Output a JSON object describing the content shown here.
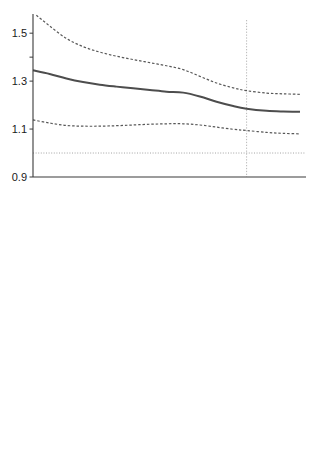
{
  "figure": {
    "background": "#ffffff",
    "width": 315,
    "height": 449
  },
  "panel_a": {
    "title": "a. World",
    "xlabel": "year",
    "ylabel": "γ̂Gl",
    "ylabel_base": "γ",
    "ylabel_sub": "Gl",
    "annotations": {
      "realisation": "realisation",
      "prediction": "prediction",
      "zipf": "Zipf",
      "series": "World"
    }
  },
  "panel_b": {
    "title": "b. Continents",
    "xlabel": "year",
    "ylabel": "γ̂Gl",
    "ylabel_base": "γ",
    "ylabel_sub": "Gl",
    "annotations": {
      "realisation": "realisation",
      "prediction": "prediction",
      "zipf": "Zipf"
    }
  },
  "chart_data": [
    {
      "type": "line",
      "title": "a. World",
      "xlabel": "year",
      "ylabel": "γ̂Gl",
      "xlim": [
        1950,
        2030
      ],
      "ylim": [
        0.9,
        1.58
      ],
      "xticks": [
        1950,
        1970,
        1990,
        2010,
        2030
      ],
      "xticks_minor": [
        1960,
        1980,
        2000,
        2020
      ],
      "yticks": [
        0.9,
        1.1,
        1.3,
        1.5
      ],
      "grid": false,
      "legend": "inline-labels",
      "divider_x": 2014,
      "divider_label_left": "realisation",
      "divider_label_right": "prediction",
      "reference_lines": [
        {
          "name": "Zipf",
          "y": 1.0,
          "style": "dotted",
          "color": "#9a9a9a"
        }
      ],
      "series": [
        {
          "name": "World",
          "style": "solid",
          "color": "#4d4d4d",
          "width": 2.0,
          "x": [
            1950,
            1955,
            1960,
            1965,
            1970,
            1975,
            1980,
            1985,
            1990,
            1995,
            2000,
            2005,
            2010,
            2014,
            2020,
            2025,
            2030
          ],
          "values": [
            1.345,
            1.33,
            1.311,
            1.296,
            1.285,
            1.277,
            1.27,
            1.263,
            1.256,
            1.252,
            1.236,
            1.214,
            1.196,
            1.185,
            1.176,
            1.173,
            1.172
          ]
        },
        {
          "name": "upper confidence bound",
          "style": "dashed",
          "color": "#585858",
          "width": 1.2,
          "x": [
            1951,
            1955,
            1960,
            1965,
            1970,
            1975,
            1980,
            1985,
            1990,
            1995,
            2000,
            2005,
            2010,
            2014,
            2020,
            2025,
            2030
          ],
          "values": [
            1.575,
            1.53,
            1.478,
            1.444,
            1.421,
            1.404,
            1.39,
            1.377,
            1.364,
            1.348,
            1.32,
            1.292,
            1.272,
            1.26,
            1.25,
            1.247,
            1.245
          ]
        },
        {
          "name": "lower confidence bound",
          "style": "dashed",
          "color": "#585858",
          "width": 1.2,
          "x": [
            1950,
            1955,
            1960,
            1965,
            1970,
            1975,
            1980,
            1985,
            1990,
            1995,
            2000,
            2005,
            2010,
            2014,
            2020,
            2025,
            2030
          ],
          "values": [
            1.138,
            1.125,
            1.115,
            1.112,
            1.112,
            1.114,
            1.117,
            1.12,
            1.122,
            1.122,
            1.117,
            1.108,
            1.099,
            1.094,
            1.086,
            1.082,
            1.08
          ]
        }
      ]
    },
    {
      "type": "line",
      "title": "b. Continents",
      "xlabel": "year",
      "ylabel": "γ̂Gl",
      "xlim": [
        1950,
        2030
      ],
      "ylim": [
        0.9,
        1.56
      ],
      "xticks": [
        1950,
        1970,
        1990,
        2010,
        2030
      ],
      "xticks_minor": [
        1960,
        1980,
        2000,
        2020
      ],
      "yticks": [
        0.9,
        1.1,
        1.3,
        1.5
      ],
      "grid": false,
      "legend": "inline-labels",
      "divider_x": 2014,
      "divider_label_left": "realisation",
      "divider_label_right": "prediction",
      "reference_lines": [
        {
          "name": "Zipf",
          "y": 1.0,
          "style": "dotted",
          "color": "#9a9a9a"
        }
      ],
      "series": [
        {
          "name": "Europe",
          "style": "solid",
          "color": "#2e2e2e",
          "width": 1.9,
          "label_color": "#7a7a7a",
          "x": [
            1950,
            1953,
            1956,
            1960,
            1964,
            1968,
            1972,
            1976,
            1980,
            1984,
            1988,
            1992,
            1996,
            2000,
            2004,
            2008,
            2012,
            2014,
            2018,
            2022,
            2026,
            2030
          ],
          "values": [
            1.47,
            1.486,
            1.492,
            1.478,
            1.474,
            1.48,
            1.485,
            1.474,
            1.466,
            1.474,
            1.482,
            1.487,
            1.486,
            1.478,
            1.466,
            1.452,
            1.44,
            1.434,
            1.428,
            1.432,
            1.436,
            1.438
          ]
        },
        {
          "name": "Africa",
          "style": "dashed",
          "color": "#bdbdbd",
          "width": 1.9,
          "label_color": "#bdbdbd",
          "x": [
            1958,
            1962,
            1966,
            1968,
            1972,
            1975,
            1978,
            1982,
            1986,
            1990,
            1994,
            1998,
            2002,
            2006,
            2010,
            2014,
            2018,
            2022,
            2026,
            2030
          ],
          "values": [
            1.37,
            1.392,
            1.34,
            1.381,
            1.42,
            1.43,
            1.42,
            1.396,
            1.355,
            1.3,
            1.248,
            1.205,
            1.175,
            1.158,
            1.148,
            1.144,
            1.142,
            1.144,
            1.146,
            1.148
          ]
        },
        {
          "name": "Asia",
          "style": "dashed",
          "color": "#4a4a4a",
          "width": 1.7,
          "label_color": "#3a3a3a",
          "x": [
            1950,
            1954,
            1958,
            1962,
            1966,
            1970,
            1974,
            1978,
            1982,
            1986,
            1990,
            1994,
            1998,
            2002,
            2006,
            2010,
            2014,
            2018,
            2022,
            2026,
            2030
          ],
          "values": [
            1.3,
            1.272,
            1.245,
            1.222,
            1.204,
            1.19,
            1.181,
            1.176,
            1.172,
            1.172,
            1.174,
            1.176,
            1.174,
            1.17,
            1.164,
            1.158,
            1.152,
            1.15,
            1.152,
            1.154,
            1.156
          ]
        },
        {
          "name": "Latin America",
          "style": "dotted",
          "color": "#3a3a3a",
          "width": 1.7,
          "label_color": "#7a7a7a",
          "x": [
            1950,
            1954,
            1958,
            1962,
            1966,
            1970,
            1974,
            1978,
            1982,
            1986,
            1990,
            1994,
            1998,
            2002,
            2006,
            2010,
            2014,
            2018,
            2022,
            2026,
            2030
          ],
          "values": [
            1.142,
            1.152,
            1.158,
            1.154,
            1.146,
            1.14,
            1.138,
            1.142,
            1.15,
            1.16,
            1.168,
            1.17,
            1.162,
            1.148,
            1.134,
            1.122,
            1.114,
            1.11,
            1.11,
            1.112,
            1.114
          ]
        },
        {
          "name": "North America",
          "style": "dashdot",
          "color": "#565656",
          "width": 1.7,
          "label_color": "#a8a8a8",
          "x": [
            1950,
            1954,
            1958,
            1962,
            1966,
            1970,
            1974,
            1978,
            1982,
            1986,
            1990,
            1994,
            1998,
            2002,
            2006,
            2010,
            2014,
            2018,
            2022,
            2026,
            2030
          ],
          "values": [
            1.188,
            1.18,
            1.172,
            1.166,
            1.162,
            1.16,
            1.158,
            1.156,
            1.152,
            1.146,
            1.138,
            1.128,
            1.118,
            1.11,
            1.104,
            1.1,
            1.098,
            1.1,
            1.104,
            1.106,
            1.108
          ]
        }
      ]
    }
  ],
  "inline_labels": {
    "panel_a": [
      {
        "text": "World",
        "x": 62,
        "y": 95,
        "color": "#7a7a7a"
      }
    ],
    "panel_b": [
      {
        "text": "Europe",
        "x": 75,
        "y": 253,
        "color": "#7a7a7a"
      },
      {
        "text": "Africa",
        "x": 110,
        "y": 287,
        "color": "#bdbdbd"
      },
      {
        "text": "Asia",
        "x": 42,
        "y": 316,
        "color": "#3a3a3a"
      },
      {
        "text": "Latin America",
        "x": 27,
        "y": 359,
        "color": "#6e6e6e"
      },
      {
        "text": "North America",
        "x": 150,
        "y": 377,
        "color": "#a8a8a8"
      }
    ]
  }
}
